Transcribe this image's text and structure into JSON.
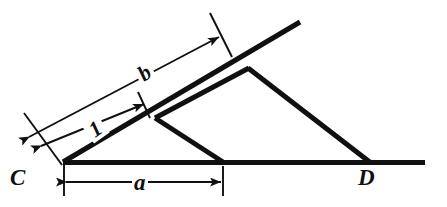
{
  "figure": {
    "type": "geometry-diagram",
    "background_color": "#ffffff",
    "stroke_color": "#101010",
    "labels": {
      "vertex_left": "C",
      "vertex_right": "D",
      "dimension_base": "a",
      "dimension_ray_long": "b",
      "dimension_ray_short": "1"
    },
    "points": {
      "C": [
        63,
        162
      ],
      "D": [
        370,
        163
      ],
      "inner_apex": [
        155,
        118
      ],
      "inner_foot": [
        222,
        162
      ],
      "outer_apex": [
        248,
        68
      ],
      "ray_end": [
        300,
        22
      ],
      "base_end": [
        425,
        163
      ]
    },
    "dimensions": [
      {
        "name": "a",
        "label": "a",
        "from": [
          63,
          162
        ],
        "to": [
          222,
          162
        ],
        "placement": "below-baseline"
      },
      {
        "name": "1",
        "label": "1",
        "from": [
          63,
          162
        ],
        "to": [
          145,
          117
        ],
        "placement": "along-ray-inner"
      },
      {
        "name": "b",
        "label": "b",
        "from": [
          63,
          162
        ],
        "to": [
          222,
          38
        ],
        "placement": "along-ray-outer"
      }
    ]
  }
}
